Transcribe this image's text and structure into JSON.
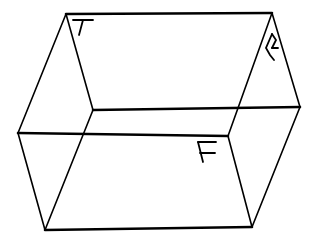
{
  "diagram": {
    "face_labels": [
      {
        "id": "top",
        "text": "T"
      },
      {
        "id": "right",
        "text": "R"
      },
      {
        "id": "front",
        "text": "F"
      }
    ],
    "colors": {
      "stroke": "#000000",
      "background": "#ffffff"
    }
  }
}
